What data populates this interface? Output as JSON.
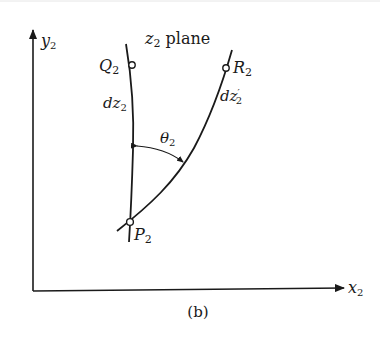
{
  "figure": {
    "caption": "(b)",
    "plane_label": {
      "main": "z",
      "sub": "2",
      "suffix": " plane"
    },
    "axes": {
      "y": {
        "main": "y",
        "sub": "2"
      },
      "x": {
        "main": "x",
        "sub": "2"
      }
    },
    "points": {
      "P": {
        "main": "P",
        "sub": "2"
      },
      "Q": {
        "main": "Q",
        "sub": "2"
      },
      "R": {
        "main": "R",
        "sub": "2"
      }
    },
    "segments": {
      "dz": {
        "main": "dz",
        "sub": "2"
      },
      "dz_prime": {
        "main": "dz",
        "prime": "′",
        "sub": "2"
      }
    },
    "angle": {
      "main": "θ",
      "sub": "2"
    }
  },
  "colors": {
    "ink": "#1a1a1a",
    "background": "#ffffff"
  }
}
